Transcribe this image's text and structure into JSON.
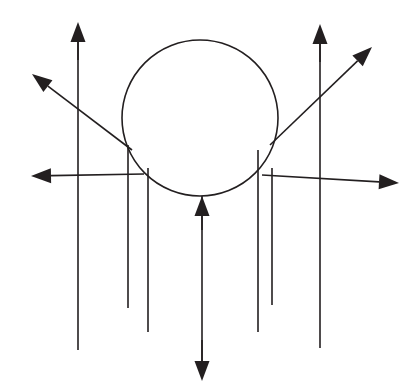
{
  "figure": {
    "title": "Field line diagram with circular body",
    "canvas": {
      "width": 414,
      "height": 391,
      "background": "#ffffff"
    },
    "ink_color": "#231f20",
    "stroke_width": 1.6,
    "body": {
      "name": "circle",
      "shape": "circle",
      "center_x": 200,
      "center_y": 118,
      "radius": 78,
      "fill": "none",
      "stroke": "#231f20",
      "stroke_width": 1.6
    },
    "vertical_lines": [
      {
        "id": "v1",
        "x": 78,
        "y_top": 28,
        "y_bottom": 350,
        "arrow": "none"
      },
      {
        "id": "v2",
        "x": 128,
        "y_top": 145,
        "y_bottom": 308,
        "arrow": "none"
      },
      {
        "id": "v3",
        "x": 148,
        "y_top": 168,
        "y_bottom": 332,
        "arrow": "none"
      },
      {
        "id": "v4",
        "x": 202,
        "y_top": 196,
        "y_bottom": 372,
        "arrow": "both"
      },
      {
        "id": "v5",
        "x": 258,
        "y_top": 150,
        "y_bottom": 332,
        "arrow": "none"
      },
      {
        "id": "v6",
        "x": 272,
        "y_top": 168,
        "y_bottom": 305,
        "arrow": "none"
      },
      {
        "id": "v7",
        "x": 320,
        "y_top": 30,
        "y_bottom": 348,
        "arrow": "none"
      }
    ],
    "arrows": [
      {
        "id": "a-up-left-vertical",
        "label": "upward arrow left",
        "direction": "up",
        "tail_x": 78,
        "tail_y": 60,
        "tip_x": 78,
        "tip_y": 22
      },
      {
        "id": "a-up-right-vertical",
        "label": "upward arrow right",
        "direction": "up",
        "tail_x": 320,
        "tail_y": 62,
        "tip_x": 320,
        "tip_y": 24
      },
      {
        "id": "a-diag-upper-left",
        "label": "upper-left diagonal arrow",
        "direction": "up-left",
        "tail_x": 132,
        "tail_y": 150,
        "tip_x": 32,
        "tip_y": 74
      },
      {
        "id": "a-diag-upper-right",
        "label": "upper-right diagonal arrow",
        "direction": "up-right",
        "tail_x": 270,
        "tail_y": 145,
        "tip_x": 372,
        "tip_y": 47
      },
      {
        "id": "a-horizontal-left",
        "label": "left horizontal arrow",
        "direction": "left",
        "tail_x": 144,
        "tail_y": 174,
        "tip_x": 31,
        "tip_y": 176
      },
      {
        "id": "a-horizontal-right",
        "label": "right horizontal arrow",
        "direction": "right",
        "tail_x": 262,
        "tail_y": 175,
        "tip_x": 399,
        "tip_y": 183
      },
      {
        "id": "a-center-up",
        "label": "upward arrow into circle base",
        "direction": "up",
        "tail_x": 202,
        "tail_y": 230,
        "tip_x": 202,
        "tip_y": 196
      },
      {
        "id": "a-center-down",
        "label": "downward arrow at bottom",
        "direction": "down",
        "tail_x": 202,
        "tail_y": 340,
        "tip_x": 202,
        "tip_y": 381
      }
    ],
    "arrow_head": {
      "length": 20,
      "half_width": 7.5
    }
  }
}
